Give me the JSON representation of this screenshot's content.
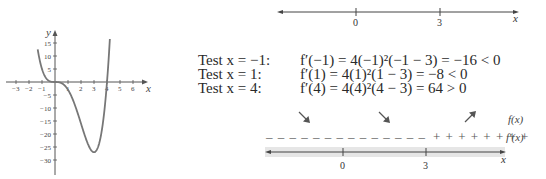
{
  "graph": {
    "function": "f(x) = x^4 - 4x^3",
    "x_axis_label": "x",
    "y_axis_label": "y",
    "x_ticks": [
      "-3",
      "-2",
      "-1",
      "1",
      "2",
      "3",
      "4",
      "5",
      "6"
    ],
    "y_ticks": [
      "15",
      "10",
      "5",
      "-5",
      "-10",
      "-15",
      "-20",
      "-25",
      "-30"
    ],
    "curve_color": "#777777"
  },
  "top_number_line": {
    "points": [
      "0",
      "3"
    ],
    "var": "x"
  },
  "tests": [
    {
      "label": "Test x = −1:",
      "expr": "f′(−1) = 4(−1)²(−1 − 3) = −16 < 0"
    },
    {
      "label": "Test x = 1:",
      "expr": "f′(1) = 4(1)²(1 − 3) = −8 < 0"
    },
    {
      "label": "Test x = 4:",
      "expr": "f′(4) = 4(4)²(4 − 3) = 64 > 0"
    }
  ],
  "sign_chart": {
    "f_label": "f(x)",
    "fprime_label": "f′(x)",
    "intervals": [
      {
        "arrow": "decreasing",
        "signs": "– – – – – – –"
      },
      {
        "arrow": "decreasing",
        "signs": "– – – – – – –"
      },
      {
        "arrow": "increasing",
        "signs": "+ + + + + + + +"
      }
    ],
    "points": [
      "0",
      "3"
    ],
    "var": "x",
    "band_color": "#e6e6e6"
  },
  "chart_data": {
    "type": "line",
    "title": "",
    "function": "f(x) = x^4 - 4x^3",
    "xlabel": "x",
    "ylabel": "y",
    "xlim": [
      -3.5,
      7
    ],
    "ylim": [
      -33,
      18
    ],
    "x_ticks": [
      -3,
      -2,
      -1,
      1,
      2,
      3,
      4,
      5,
      6
    ],
    "y_ticks": [
      15,
      10,
      5,
      -5,
      -10,
      -15,
      -20,
      -25,
      -30
    ],
    "grid": false,
    "series": [
      {
        "name": "f(x)",
        "x": [
          -1.3,
          -1,
          -0.5,
          0,
          0.5,
          1,
          1.5,
          2,
          2.5,
          3,
          3.5,
          4,
          4.2
        ],
        "values": [
          11.7,
          5,
          0.56,
          0,
          -0.44,
          -3,
          -8.4,
          -16,
          -23.4,
          -27,
          -21.4,
          0,
          14.8
        ]
      }
    ],
    "annotations": [
      "local min at (3, -27)",
      "horizontal tangent at (0, 0)"
    ]
  }
}
